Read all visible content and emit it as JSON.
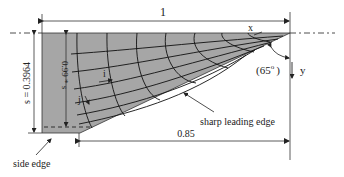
{
  "diagram": {
    "dimensions": {
      "chord_length": "1",
      "span_s": "s = 0.3964",
      "inner_span": "0.99 * s",
      "leading_edge_extent": "0.85"
    },
    "axes": {
      "x_label": "x",
      "y_label": "y",
      "i_label": "i",
      "j_label": "j"
    },
    "angle": {
      "label": "(65",
      "degree": "o",
      "close": ")"
    },
    "annotations": {
      "sharp_leading_edge": "sharp leading edge",
      "side_edge": "side edge"
    },
    "colors": {
      "surface_fill": "#a8a8a8",
      "grid_lines": "#111111",
      "dimension_lines": "#333333"
    }
  }
}
